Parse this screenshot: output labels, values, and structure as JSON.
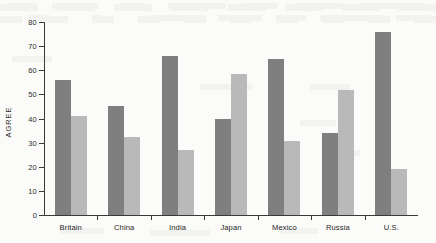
{
  "chart_data": {
    "type": "bar",
    "title": "",
    "xlabel": "",
    "ylabel": "AGREE",
    "ylim": [
      0,
      80
    ],
    "yticks": [
      0,
      10,
      20,
      30,
      40,
      50,
      60,
      70,
      80
    ],
    "grid": false,
    "legend": "none",
    "categories": [
      "Britain",
      "China",
      "India",
      "Japan",
      "Mexico",
      "Russia",
      "U.S."
    ],
    "series": [
      {
        "name": "series-1",
        "color": "#7f7f7f",
        "values": [
          56,
          45,
          66,
          40,
          64.5,
          34,
          76
        ]
      },
      {
        "name": "series-2",
        "color": "#b9b9b9",
        "values": [
          41,
          32.5,
          27,
          58.5,
          30.5,
          52,
          19
        ]
      }
    ]
  },
  "axis": {
    "y_title": "AGREE",
    "tick_labels": [
      "0",
      "10",
      "20",
      "30",
      "40",
      "50",
      "60",
      "70",
      "80"
    ]
  }
}
